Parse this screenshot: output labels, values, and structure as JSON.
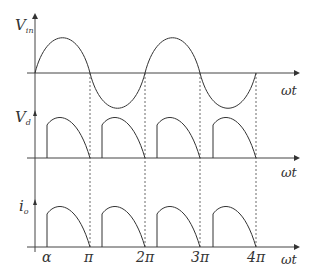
{
  "diagram": {
    "type": "waveform",
    "panels": [
      {
        "id": "vin",
        "label_main": "V",
        "label_sub": "in",
        "x_label": "ωt",
        "waveform": "full sine"
      },
      {
        "id": "vd",
        "label_main": "V",
        "label_sub": "d",
        "x_label": "ωt",
        "waveform": "phase-controlled half pulses from α to π"
      },
      {
        "id": "io",
        "label_main": "i",
        "label_sub": "o",
        "x_label": "ωt",
        "waveform": "phase-controlled half pulses from α to π"
      }
    ],
    "x_ticks": [
      "α",
      "π",
      "2π",
      "3π",
      "4π"
    ],
    "colors": {
      "line": "#333333",
      "dashed": "#444444",
      "background": "#ffffff"
    }
  }
}
